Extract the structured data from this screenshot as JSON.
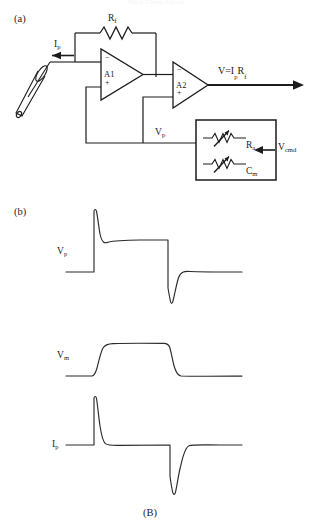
{
  "figure": {
    "header_text": "Patch Clamp Circuit",
    "caption": "(B)",
    "panels": [
      {
        "id": "a",
        "label": "(a)"
      },
      {
        "id": "b",
        "label": "(b)"
      }
    ]
  },
  "circuit": {
    "labels": {
      "feedback_resistor": "R",
      "feedback_resistor_sub": "f",
      "pipette_current": "I",
      "pipette_current_sub": "p",
      "output_equation": "V=I",
      "output_equation_sub1": "p",
      "output_equation_mid": "R",
      "output_equation_sub2": "f",
      "amp1": "A1",
      "amp2": "A2",
      "pipette_voltage": "V",
      "pipette_voltage_sub": "p",
      "series_resistance": "R",
      "series_resistance_sub": "a",
      "membrane_capacitance": "C",
      "membrane_capacitance_sub": "m",
      "command_voltage": "V",
      "command_voltage_sub": "cmd",
      "inverting_input": "−",
      "noninverting_input": "+"
    },
    "components": [
      "pipette-electrode",
      "feedback-resistor",
      "operational-amplifier-a1",
      "operational-amplifier-a2",
      "compensation-box",
      "series-resistance-potentiometer",
      "membrane-capacitance-potentiometer"
    ]
  },
  "chart_data": [
    {
      "type": "line",
      "name": "pipette-voltage-trace",
      "title": "",
      "ylabel": "Vp",
      "xlabel": "",
      "series": [
        {
          "name": "Vp",
          "description": "Baseline, fast positive spike at step onset decaying to elevated plateau, then fast negative spike at step offset recovering to baseline",
          "x": [
            0,
            30,
            30,
            32,
            36,
            44,
            56,
            76,
            104,
            104,
            107,
            112,
            122,
            140,
            185
          ],
          "y": [
            0,
            0,
            72,
            100,
            88,
            80,
            77,
            76,
            76,
            4,
            -24,
            -8,
            0,
            0,
            0
          ]
        }
      ],
      "ylim": [
        -30,
        105
      ],
      "grid": false,
      "legend": "none"
    },
    {
      "type": "line",
      "name": "membrane-voltage-trace",
      "title": "",
      "ylabel": "Vm",
      "xlabel": "",
      "series": [
        {
          "name": "Vm",
          "description": "Baseline, smooth exponential rise to plateau, sustained plateau, smooth exponential decay back to baseline",
          "x": [
            0,
            30,
            34,
            40,
            48,
            60,
            104,
            108,
            114,
            122,
            136,
            185
          ],
          "y": [
            0,
            0,
            30,
            70,
            90,
            96,
            96,
            70,
            28,
            6,
            0,
            0
          ]
        }
      ],
      "ylim": [
        -10,
        100
      ],
      "grid": false,
      "legend": "none"
    },
    {
      "type": "line",
      "name": "pipette-current-trace",
      "title": "",
      "ylabel": "Ip",
      "xlabel": "",
      "series": [
        {
          "name": "Ip",
          "description": "Flat baseline with sharp positive capacitive transient at step onset and sharp negative capacitive transient at step offset",
          "x": [
            0,
            30,
            31,
            33,
            38,
            46,
            60,
            104,
            105,
            107,
            112,
            120,
            135,
            185
          ],
          "y": [
            0,
            0,
            90,
            100,
            40,
            8,
            0,
            0,
            -60,
            -86,
            -40,
            -8,
            0,
            0
          ]
        }
      ],
      "ylim": [
        -90,
        105
      ],
      "grid": false,
      "legend": "none"
    }
  ]
}
